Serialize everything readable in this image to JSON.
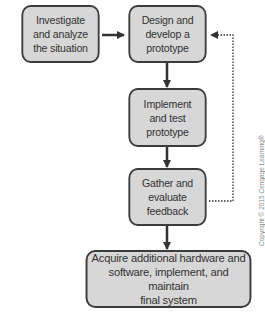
{
  "diagram": {
    "type": "flowchart",
    "nodes": [
      {
        "id": "investigate",
        "label": "Investigate\nand analyze\nthe situation"
      },
      {
        "id": "design",
        "label": "Design and\ndevelop a\nprototype"
      },
      {
        "id": "implement",
        "label": "Implement\nand test\nprototype"
      },
      {
        "id": "gather",
        "label": "Gather and\nevaluate\nfeedback"
      },
      {
        "id": "acquire",
        "label": "Acquire additional hardware and\nsoftware, implement, and maintain\nfinal system"
      }
    ],
    "edges": [
      {
        "from": "investigate",
        "to": "design",
        "style": "solid"
      },
      {
        "from": "design",
        "to": "implement",
        "style": "solid"
      },
      {
        "from": "implement",
        "to": "gather",
        "style": "solid"
      },
      {
        "from": "gather",
        "to": "acquire",
        "style": "solid"
      },
      {
        "from": "gather",
        "to": "design",
        "style": "dotted"
      }
    ],
    "copyright": "Copyright © 2015 Cengage Learning®",
    "colors": {
      "box_fill": "#d7d7d7",
      "box_border": "#3c3c3c",
      "arrow": "#333333"
    }
  }
}
